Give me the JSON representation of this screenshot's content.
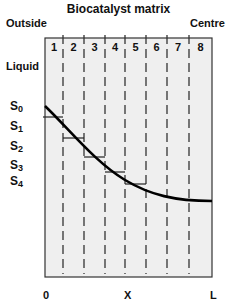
{
  "title": "Biocatalyst matrix",
  "left_label": "Outside",
  "right_label": "Centre",
  "liquid_label": "Liquid",
  "segments": [
    "1",
    "2",
    "3",
    "4",
    "5",
    "6",
    "7",
    "8"
  ],
  "s_labels": [
    {
      "base": "S",
      "sub": "0"
    },
    {
      "base": "S",
      "sub": "1"
    },
    {
      "base": "S",
      "sub": "2"
    },
    {
      "base": "S",
      "sub": "3"
    },
    {
      "base": "S",
      "sub": "4"
    }
  ],
  "x_axis": {
    "start": "0",
    "middle": "X",
    "end": "L"
  },
  "colors": {
    "box_fill": "#efefef",
    "line": "#000000",
    "divider": "#333333"
  }
}
